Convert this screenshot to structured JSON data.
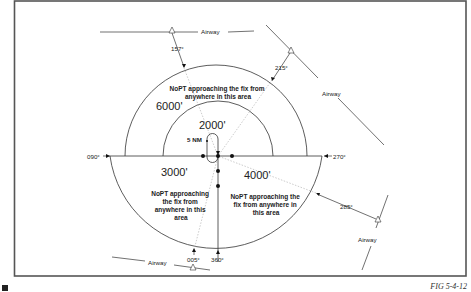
{
  "figure": {
    "caption": "FIG 5-4-12",
    "border_color": "#555555",
    "line_color": "#333333",
    "marker_color": "#111111"
  },
  "altitudes": {
    "outer_upper": "6000'",
    "inner_upper": "2000'",
    "lower_left": "3000'",
    "lower_right": "4000'"
  },
  "holding": {
    "leg_length_label": "5 NM"
  },
  "areas": {
    "upper": [
      "NoPT approaching the fix from",
      "anywhere in this area"
    ],
    "lower_left": [
      "NoPT approaching",
      "the fix from",
      "anywhere in this",
      "area"
    ],
    "lower_right": [
      "NoPT approaching the",
      "fix from anywhere in",
      "this area"
    ]
  },
  "bearings": {
    "b090": "090°",
    "b270": "270°",
    "b157": "157°",
    "b215": "215°",
    "b285": "285°",
    "b005": "005°",
    "b360": "360°"
  },
  "airways": {
    "top": "Airway",
    "right": "Airway",
    "lower_right": "Airway",
    "bottom": "Airway"
  }
}
